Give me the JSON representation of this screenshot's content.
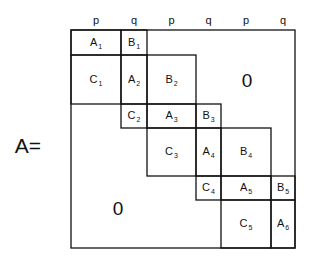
{
  "matrix_name": "A=",
  "column_headers": [
    "p",
    "q",
    "p",
    "q",
    "p",
    "q"
  ],
  "grid": {
    "x": [
      71,
      121,
      147,
      196,
      221,
      271,
      295
    ],
    "y": [
      30,
      55,
      104,
      128,
      176,
      200,
      248
    ],
    "stroke": "#111111"
  },
  "blocks": [
    {
      "letter": "A",
      "sub": "1",
      "x1": 71,
      "y1": 30,
      "x2": 121,
      "y2": 55
    },
    {
      "letter": "B",
      "sub": "1",
      "x1": 121,
      "y1": 30,
      "x2": 147,
      "y2": 55
    },
    {
      "letter": "C",
      "sub": "1",
      "x1": 71,
      "y1": 55,
      "x2": 121,
      "y2": 104
    },
    {
      "letter": "A",
      "sub": "2",
      "x1": 121,
      "y1": 55,
      "x2": 147,
      "y2": 104
    },
    {
      "letter": "B",
      "sub": "2",
      "x1": 147,
      "y1": 55,
      "x2": 196,
      "y2": 104
    },
    {
      "letter": "C",
      "sub": "2",
      "x1": 121,
      "y1": 104,
      "x2": 147,
      "y2": 128
    },
    {
      "letter": "A",
      "sub": "3",
      "x1": 147,
      "y1": 104,
      "x2": 196,
      "y2": 128
    },
    {
      "letter": "B",
      "sub": "3",
      "x1": 196,
      "y1": 104,
      "x2": 221,
      "y2": 128
    },
    {
      "letter": "C",
      "sub": "3",
      "x1": 147,
      "y1": 128,
      "x2": 196,
      "y2": 176
    },
    {
      "letter": "A",
      "sub": "4",
      "x1": 196,
      "y1": 128,
      "x2": 221,
      "y2": 176
    },
    {
      "letter": "B",
      "sub": "4",
      "x1": 221,
      "y1": 128,
      "x2": 271,
      "y2": 176
    },
    {
      "letter": "C",
      "sub": "4",
      "x1": 196,
      "y1": 176,
      "x2": 221,
      "y2": 200
    },
    {
      "letter": "A",
      "sub": "5",
      "x1": 221,
      "y1": 176,
      "x2": 271,
      "y2": 200
    },
    {
      "letter": "B",
      "sub": "5",
      "x1": 271,
      "y1": 176,
      "x2": 295,
      "y2": 200
    },
    {
      "letter": "C",
      "sub": "5",
      "x1": 221,
      "y1": 200,
      "x2": 271,
      "y2": 248
    },
    {
      "letter": "A",
      "sub": "6",
      "x1": 271,
      "y1": 200,
      "x2": 295,
      "y2": 248
    }
  ],
  "zero_regions": [
    {
      "label": "0",
      "name": "upper-right-zero",
      "cx": 247,
      "cy": 80
    },
    {
      "label": "0",
      "name": "lower-left-zero",
      "cx": 118,
      "cy": 208
    }
  ]
}
